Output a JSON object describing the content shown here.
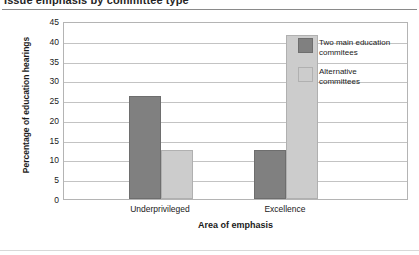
{
  "chart_data": {
    "type": "bar",
    "title": "Issue emphasis by committee type",
    "xlabel": "Area of emphasis",
    "ylabel": "Percentage of education hearings",
    "categories": [
      "Underprivileged",
      "Excellence"
    ],
    "series": [
      {
        "name": "Two main education commitees",
        "color": "#808080",
        "values": [
          26,
          12.5
        ]
      },
      {
        "name": "Alternative committees",
        "color": "#cccccc",
        "values": [
          12.5,
          41.5
        ]
      }
    ],
    "ylim": [
      0,
      45
    ],
    "yticks": [
      0,
      5,
      10,
      15,
      20,
      25,
      30,
      35,
      40,
      45
    ],
    "ytick_labels": [
      "0",
      "5",
      "10",
      "15",
      "20",
      "25",
      "30",
      "35",
      "40",
      "45"
    ],
    "grid": true,
    "legend_position": "inside-top-right"
  },
  "legend": {
    "entries": [
      {
        "label_line1": "Two main education",
        "label_line2": "commitees"
      },
      {
        "label_line1": "Alternative",
        "label_line2": "committees"
      }
    ]
  }
}
